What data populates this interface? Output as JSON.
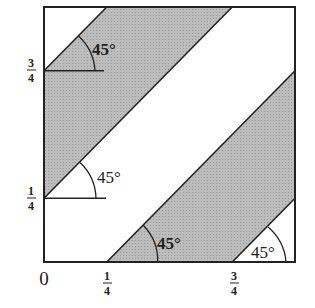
{
  "figure": {
    "colors": {
      "shade": "#b8b8b8",
      "stroke": "#222222",
      "background": "#ffffff"
    },
    "labels": {
      "origin": "0",
      "x_quarter": {
        "num": "1",
        "den": "4"
      },
      "x_three_quarter": {
        "num": "3",
        "den": "4"
      },
      "y_quarter": {
        "num": "1",
        "den": "4"
      },
      "y_three_quarter": {
        "num": "3",
        "den": "4"
      }
    },
    "angles": [
      {
        "label": "45°",
        "at": "(0, 3/4)"
      },
      {
        "label": "45°",
        "at": "(0, 1/4)"
      },
      {
        "label": "45°",
        "at": "(1/4, 0)"
      },
      {
        "label": "45°",
        "at": "(3/4, 0)"
      }
    ],
    "bands": [
      {
        "name": "upper-left band",
        "between": [
          "y = x + 1/4",
          "y = x + 3/4"
        ]
      },
      {
        "name": "lower-right band",
        "between": [
          "y = x - 3/4",
          "y = x - 1/4"
        ]
      }
    ]
  }
}
